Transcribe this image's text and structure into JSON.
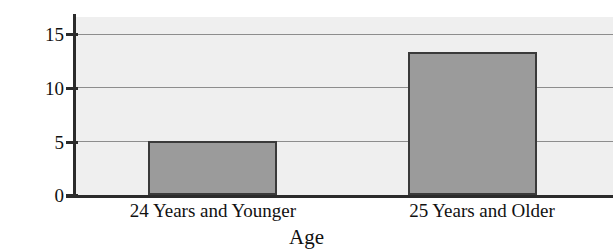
{
  "chart_data": {
    "type": "bar",
    "title": "",
    "xlabel": "Age",
    "ylabel": "Accidents (millions)",
    "categories": [
      "24 Years and Younger",
      "25 Years and Older"
    ],
    "values": [
      5.0,
      13.3
    ],
    "ylim": [
      0,
      16.2
    ],
    "yticks": [
      0,
      5,
      10,
      15
    ],
    "ytick_labels": [
      "0",
      "5",
      "10",
      "15"
    ],
    "grid": true,
    "legend": "none",
    "colors": {
      "bar_fill": "#9b9b9b",
      "bar_edge": "#3a3a3a",
      "plot_background": "#efefef",
      "gridline": "#8d8d8d",
      "axis": "#2b2b2b",
      "text": "#111111"
    }
  },
  "axes": {
    "y_tick_0": "0",
    "y_tick_1": "5",
    "y_tick_2": "10",
    "y_tick_3": "15",
    "y_title": "Accidents (millions)",
    "x_title": "Age"
  },
  "bars": [
    {
      "category": "24 Years and Younger",
      "value": 5.0
    },
    {
      "category": "25 Years and Older",
      "value": 13.3
    }
  ]
}
